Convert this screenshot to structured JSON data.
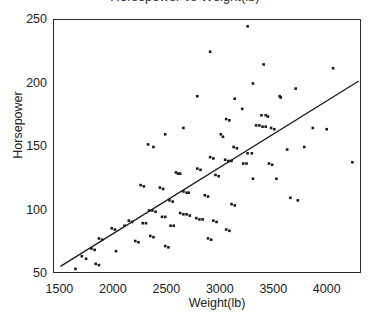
{
  "chart_data": {
    "type": "scatter",
    "title": "Horsepower vs Weight(lb)",
    "xlabel": "Weight(lb)",
    "ylabel": "Horsepower",
    "xlim": [
      1440,
      4320
    ],
    "ylim": [
      50,
      250
    ],
    "xticks": [
      1500,
      2000,
      2500,
      3000,
      3500,
      4000
    ],
    "yticks": [
      50,
      100,
      150,
      200,
      250
    ],
    "y_minor_ticks": [
      75,
      125,
      175,
      225
    ],
    "grid": false,
    "legend": false,
    "marker": "square",
    "marker_color": "#1a1a1a",
    "marker_size": 2.6,
    "trendline": {
      "type": "linear",
      "x": [
        1500,
        4290
      ],
      "y": [
        56,
        202
      ],
      "color": "#1a1a1a"
    },
    "points": [
      [
        3250,
        245
      ],
      [
        2900,
        225
      ],
      [
        3400,
        215
      ],
      [
        4050,
        212
      ],
      [
        3300,
        200
      ],
      [
        3700,
        196
      ],
      [
        3550,
        190
      ],
      [
        3560,
        189
      ],
      [
        2780,
        190
      ],
      [
        3130,
        188
      ],
      [
        3200,
        180
      ],
      [
        3380,
        175
      ],
      [
        3420,
        175
      ],
      [
        3440,
        174
      ],
      [
        3050,
        172
      ],
      [
        3080,
        171
      ],
      [
        3330,
        167
      ],
      [
        3360,
        167
      ],
      [
        3390,
        166
      ],
      [
        3420,
        166
      ],
      [
        3470,
        165
      ],
      [
        3500,
        164
      ],
      [
        4230,
        138
      ],
      [
        3860,
        165
      ],
      [
        3990,
        164
      ],
      [
        3000,
        160
      ],
      [
        3020,
        158
      ],
      [
        2650,
        165
      ],
      [
        2480,
        160
      ],
      [
        2320,
        152
      ],
      [
        2370,
        150
      ],
      [
        3120,
        150
      ],
      [
        3150,
        149
      ],
      [
        3250,
        145
      ],
      [
        3290,
        145
      ],
      [
        3620,
        148
      ],
      [
        3780,
        150
      ],
      [
        2900,
        142
      ],
      [
        2930,
        141
      ],
      [
        3040,
        140
      ],
      [
        3070,
        139
      ],
      [
        3100,
        139
      ],
      [
        3210,
        137
      ],
      [
        3240,
        137
      ],
      [
        3450,
        137
      ],
      [
        3480,
        136
      ],
      [
        2780,
        133
      ],
      [
        2810,
        132
      ],
      [
        2580,
        130
      ],
      [
        2600,
        129
      ],
      [
        2620,
        129
      ],
      [
        2950,
        128
      ],
      [
        2980,
        127
      ],
      [
        3300,
        125
      ],
      [
        3520,
        125
      ],
      [
        3650,
        110
      ],
      [
        3720,
        108
      ],
      [
        2250,
        120
      ],
      [
        2280,
        119
      ],
      [
        2430,
        118
      ],
      [
        2460,
        117
      ],
      [
        2650,
        115
      ],
      [
        2680,
        114
      ],
      [
        2700,
        114
      ],
      [
        2850,
        112
      ],
      [
        2880,
        111
      ],
      [
        2520,
        108
      ],
      [
        2550,
        107
      ],
      [
        3100,
        105
      ],
      [
        3130,
        104
      ],
      [
        2330,
        100
      ],
      [
        2360,
        100
      ],
      [
        2390,
        99
      ],
      [
        2620,
        98
      ],
      [
        2650,
        97
      ],
      [
        2680,
        97
      ],
      [
        2710,
        96
      ],
      [
        2450,
        95
      ],
      [
        2480,
        95
      ],
      [
        2770,
        94
      ],
      [
        2800,
        93
      ],
      [
        2830,
        93
      ],
      [
        2930,
        92
      ],
      [
        2960,
        91
      ],
      [
        2270,
        90
      ],
      [
        2300,
        90
      ],
      [
        2530,
        88
      ],
      [
        2560,
        88
      ],
      [
        2140,
        92
      ],
      [
        2170,
        91
      ],
      [
        2100,
        88
      ],
      [
        1980,
        86
      ],
      [
        2010,
        85
      ],
      [
        3050,
        85
      ],
      [
        3080,
        84
      ],
      [
        2880,
        78
      ],
      [
        2910,
        77
      ],
      [
        2340,
        80
      ],
      [
        2370,
        79
      ],
      [
        1860,
        78
      ],
      [
        1890,
        77
      ],
      [
        2200,
        76
      ],
      [
        2230,
        75
      ],
      [
        2480,
        72
      ],
      [
        2510,
        71
      ],
      [
        1790,
        70
      ],
      [
        1820,
        69
      ],
      [
        2020,
        68
      ],
      [
        1700,
        64
      ],
      [
        1740,
        62
      ],
      [
        1830,
        58
      ],
      [
        1860,
        57
      ],
      [
        1640,
        54
      ]
    ]
  }
}
